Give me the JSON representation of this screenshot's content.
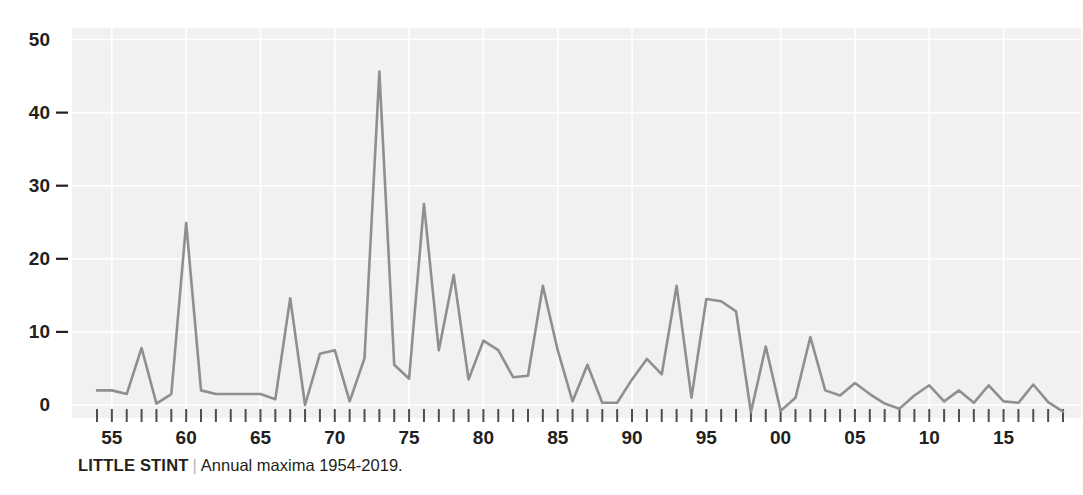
{
  "caption": {
    "title": "LITTLE STINT",
    "separator": "|",
    "subtitle": "Annual maxima 1954-2019."
  },
  "colors": {
    "line": "#8f8f8f",
    "plot_background": "#f1f1f1",
    "gridline": "#ffffff",
    "tick": "#4d4d4d",
    "text": "#231f20",
    "separator": "#b6b6b6"
  },
  "chart_data": {
    "type": "line",
    "title": "LITTLE STINT",
    "subtitle": "Annual maxima 1954-2019.",
    "xlabel": "",
    "ylabel": "",
    "xlim": [
      1954,
      2019
    ],
    "ylim": [
      -2,
      50
    ],
    "grid": true,
    "legend": false,
    "ytick_values": [
      0,
      10,
      20,
      30,
      40,
      50
    ],
    "ytick_labels": [
      "0",
      "10",
      "20",
      "30",
      "40",
      "50"
    ],
    "xtick_values": [
      1955,
      1960,
      1965,
      1970,
      1975,
      1980,
      1985,
      1990,
      1995,
      2000,
      2005,
      2010,
      2015
    ],
    "xtick_labels": [
      "55",
      "60",
      "65",
      "70",
      "75",
      "80",
      "85",
      "90",
      "95",
      "00",
      "05",
      "10",
      "15"
    ],
    "x": [
      1954,
      1955,
      1956,
      1957,
      1958,
      1959,
      1960,
      1961,
      1962,
      1963,
      1964,
      1965,
      1966,
      1967,
      1968,
      1969,
      1970,
      1971,
      1972,
      1973,
      1974,
      1975,
      1976,
      1977,
      1978,
      1979,
      1980,
      1981,
      1982,
      1983,
      1984,
      1985,
      1986,
      1987,
      1988,
      1989,
      1990,
      1991,
      1992,
      1993,
      1994,
      1995,
      1996,
      1997,
      1998,
      1999,
      2000,
      2001,
      2002,
      2003,
      2004,
      2005,
      2006,
      2007,
      2008,
      2009,
      2010,
      2011,
      2012,
      2013,
      2014,
      2015,
      2016,
      2017,
      2018,
      2019
    ],
    "values": [
      2.0,
      2.0,
      1.5,
      7.8,
      0.2,
      1.5,
      24.9,
      2.0,
      1.5,
      1.5,
      1.5,
      1.5,
      0.8,
      14.6,
      0.0,
      7.0,
      7.5,
      0.5,
      6.4,
      45.6,
      5.5,
      3.6,
      27.5,
      7.5,
      17.8,
      3.5,
      8.8,
      7.5,
      3.8,
      4.0,
      16.3,
      7.5,
      0.5,
      5.5,
      0.3,
      0.3,
      3.5,
      6.3,
      4.2,
      16.3,
      1.0,
      14.5,
      14.2,
      12.8,
      -1.0,
      8.0,
      -0.8,
      1.0,
      9.3,
      2.0,
      1.3,
      3.0,
      1.5,
      0.2,
      -0.5,
      1.3,
      2.7,
      0.5,
      2.0,
      0.3,
      2.7,
      0.5,
      0.3,
      2.8,
      0.4,
      -0.9
    ],
    "series": [
      {
        "name": "Annual maxima",
        "values": [
          2.0,
          2.0,
          1.5,
          7.8,
          0.2,
          1.5,
          24.9,
          2.0,
          1.5,
          1.5,
          1.5,
          1.5,
          0.8,
          14.6,
          0.0,
          7.0,
          7.5,
          0.5,
          6.4,
          45.6,
          5.5,
          3.6,
          27.5,
          7.5,
          17.8,
          3.5,
          8.8,
          7.5,
          3.8,
          4.0,
          16.3,
          7.5,
          0.5,
          5.5,
          0.3,
          0.3,
          3.5,
          6.3,
          4.2,
          16.3,
          1.0,
          14.5,
          14.2,
          12.8,
          -1.0,
          8.0,
          -0.8,
          1.0,
          9.3,
          2.0,
          1.3,
          3.0,
          1.5,
          0.2,
          -0.5,
          1.3,
          2.7,
          0.5,
          2.0,
          0.3,
          2.7,
          0.5,
          0.3,
          2.8,
          0.4,
          -0.9
        ]
      }
    ]
  }
}
